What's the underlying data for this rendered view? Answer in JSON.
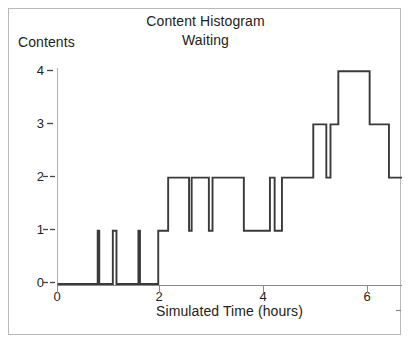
{
  "chart_data": {
    "type": "line",
    "title": "Content Histogram",
    "subtitle": "Waiting",
    "xlabel": "Simulated Time (hours)",
    "ylabel": "Contents",
    "xlim": [
      0,
      6.6
    ],
    "ylim": [
      0,
      4.3
    ],
    "grid": false,
    "legend": "none",
    "xticks": [
      0,
      2,
      4,
      6
    ],
    "xtick_labels": [
      "0",
      "2",
      "4",
      "6"
    ],
    "yticks": [
      0,
      1,
      2,
      3,
      4
    ],
    "ytick_labels": [
      "0",
      "1",
      "2",
      "3",
      "4"
    ],
    "interpolation": "step-post",
    "series": [
      {
        "name": "Waiting contents",
        "x": [
          0.0,
          0.77,
          0.8,
          1.06,
          1.13,
          1.55,
          1.58,
          1.93,
          2.12,
          2.52,
          2.57,
          2.9,
          2.97,
          3.57,
          3.62,
          4.07,
          4.16,
          4.3,
          4.38,
          4.9,
          5.15,
          5.23,
          5.38,
          5.98,
          6.35,
          6.6
        ],
        "y": [
          0,
          1,
          0,
          1,
          0,
          1,
          0,
          1,
          2,
          1,
          2,
          1,
          2,
          1,
          1,
          2,
          1,
          2,
          2,
          3,
          2,
          3,
          4,
          3,
          2,
          2
        ]
      }
    ]
  },
  "axes": {
    "y_axis_name": "contents-axis",
    "x_axis_name": "time-axis"
  }
}
